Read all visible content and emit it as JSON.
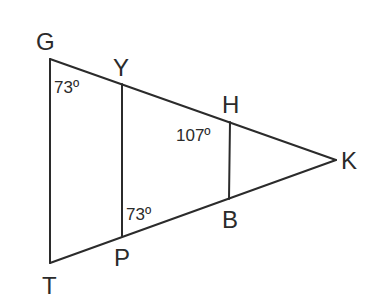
{
  "diagram": {
    "type": "geometry-figure",
    "vertices": {
      "G": {
        "label": "G",
        "x": 50,
        "y": 59
      },
      "Y": {
        "label": "Y",
        "x": 122,
        "y": 84
      },
      "H": {
        "label": "H",
        "x": 230,
        "y": 122
      },
      "K": {
        "label": "K",
        "x": 336,
        "y": 160
      },
      "B": {
        "label": "B",
        "x": 229,
        "y": 199
      },
      "P": {
        "label": "P",
        "x": 122,
        "y": 236
      },
      "T": {
        "label": "T",
        "x": 50,
        "y": 263
      }
    },
    "segments": [
      {
        "from": "G",
        "to": "K"
      },
      {
        "from": "T",
        "to": "K"
      },
      {
        "from": "G",
        "to": "T"
      },
      {
        "from": "Y",
        "to": "P"
      },
      {
        "from": "H",
        "to": "B"
      }
    ],
    "angles": {
      "angle_G": {
        "vertex": "G",
        "text": "73º"
      },
      "angle_H": {
        "vertex": "H",
        "text": "107º"
      },
      "angle_P": {
        "vertex": "P",
        "text": "73º"
      }
    }
  }
}
